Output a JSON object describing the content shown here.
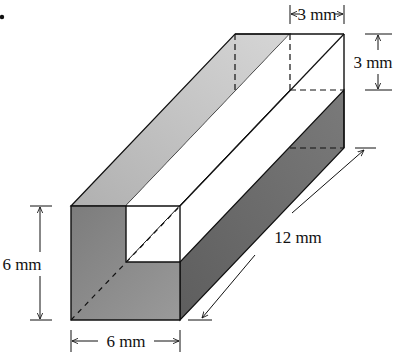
{
  "figure": {
    "marker": "•",
    "colors": {
      "top_face": "#c4c4c4",
      "front_face": "#8a8a8a",
      "side_face": "#6e6e6e",
      "groove_faces": "#ffffff",
      "outline": "#111111"
    }
  },
  "dimensions": {
    "groove_width": {
      "value": 3,
      "unit": "mm",
      "label": "3 mm"
    },
    "groove_depth": {
      "value": 3,
      "unit": "mm",
      "label": "3 mm"
    },
    "height": {
      "value": 6,
      "unit": "mm",
      "label": "6 mm"
    },
    "width": {
      "value": 6,
      "unit": "mm",
      "label": "6 mm"
    },
    "length": {
      "value": 12,
      "unit": "mm",
      "label": "12 mm"
    }
  }
}
